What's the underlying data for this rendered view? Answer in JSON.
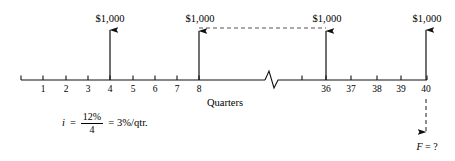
{
  "diagram": {
    "type": "cash-flow-timeline",
    "axis_title": "Quarters",
    "axis": {
      "start_x": 21,
      "end_x": 427,
      "baseline_y": 80,
      "has_break": true,
      "break_center_x": 272
    },
    "tick_labels": [
      "1",
      "2",
      "3",
      "4",
      "5",
      "6",
      "7",
      "8",
      "36",
      "37",
      "38",
      "39",
      "40"
    ],
    "ticks": [
      {
        "label": "1",
        "x": 43
      },
      {
        "label": "2",
        "x": 66
      },
      {
        "label": "3",
        "x": 88
      },
      {
        "label": "4",
        "x": 110
      },
      {
        "label": "5",
        "x": 133
      },
      {
        "label": "6",
        "x": 155
      },
      {
        "label": "7",
        "x": 177
      },
      {
        "label": "8",
        "x": 199
      },
      {
        "label": "36",
        "x": 326
      },
      {
        "label": "37",
        "x": 351
      },
      {
        "label": "38",
        "x": 377
      },
      {
        "label": "39",
        "x": 401
      },
      {
        "label": "40",
        "x": 426
      }
    ],
    "cash_inflows": [
      {
        "label": "$1,000",
        "period": "4",
        "x": 110,
        "amount": 1000,
        "direction": "up"
      },
      {
        "label": "$1,000",
        "period": "8",
        "x": 199,
        "amount": 1000,
        "direction": "up"
      },
      {
        "label": "$1,000",
        "period": "36",
        "x": 326,
        "amount": 1000,
        "direction": "up"
      },
      {
        "label": "$1,000",
        "period": "40",
        "x": 426,
        "amount": 1000,
        "direction": "up"
      }
    ],
    "connector": {
      "style": "dashed",
      "from_x": 199,
      "to_x": 326,
      "y": 28
    },
    "unknown": {
      "label_symbol": "F",
      "label_rest": " = ?",
      "period": "40",
      "x": 426,
      "direction": "down",
      "style": "dashed"
    },
    "interest": {
      "symbol": "i",
      "equals": "=",
      "numerator": "12%",
      "denominator": "4",
      "equals2": "=",
      "result": "3%/qtr."
    },
    "colors": {
      "ink": "#111111",
      "dashed": "#555555",
      "background": "#ffffff"
    }
  }
}
